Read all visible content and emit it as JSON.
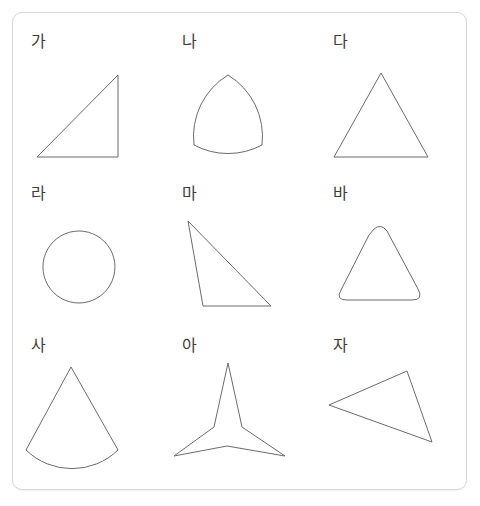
{
  "card": {
    "background_color": "#ffffff",
    "border_color": "#d8d8d8",
    "stroke_color": "#6b6b6b",
    "label_color": "#3b3b3b"
  },
  "grid": {
    "columns": 3,
    "rows": 3,
    "cells": [
      {
        "label": "가",
        "shape_name": "right-triangle",
        "icon": "right-triangle-shape",
        "geometry": "M 22,108 L 103,108 L 103,26 Z",
        "closed": true
      },
      {
        "label": "나",
        "shape_name": "reuleaux-triangle",
        "icon": "reuleaux-triangle-shape",
        "geometry": "M 62,26 A 72,72 0 0 1 96,96 A 72,72 0 0 1 28,96 A 72,72 0 0 1 62,26 Z",
        "closed": true
      },
      {
        "label": "다",
        "shape_name": "isosceles-triangle",
        "icon": "isosceles-triangle-shape",
        "geometry": "M 64,24 L 111,108 L 17,108 Z",
        "closed": true
      },
      {
        "label": "라",
        "shape_name": "circle",
        "icon": "circle-shape",
        "geometry": "M 64,30 A 36,36 0 1 1 63.9,30 Z",
        "closed": true
      },
      {
        "label": "마",
        "shape_name": "obtuse-scalene-triangle",
        "icon": "obtuse-scalene-triangle-shape",
        "geometry": "M 22,20 L 37,105 L 105,105 Z",
        "closed": true
      },
      {
        "label": "바",
        "shape_name": "rounded-triangle",
        "icon": "rounded-triangle-shape",
        "geometry": "M 57,28 Q 64,22 70,30 L 101,88 Q 107,99 95,99 L 30,99 Q 18,99 24,89 L 52,34 Z",
        "closed": true
      },
      {
        "label": "사",
        "shape_name": "circular-sector-cone",
        "icon": "circular-sector-shape",
        "geometry": "M 56,14 L 103,97 A 66,66 0 0 1 11,97 Z",
        "closed": true
      },
      {
        "label": "아",
        "shape_name": "three-pointed-star",
        "icon": "three-point-star-shape",
        "geometry": "M 62,10 L 76,74 L 119,103 L 61,93 L 8,103 L 48,74 Z",
        "closed": true
      },
      {
        "label": "자",
        "shape_name": "rotated-scalene-triangle",
        "icon": "rotated-scalene-triangle-shape",
        "geometry": "M 12,52 L 90,18 L 115,89 Z",
        "closed": true
      }
    ]
  }
}
